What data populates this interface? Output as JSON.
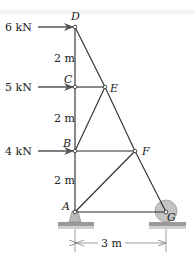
{
  "diagram": {
    "type": "truss",
    "nodes": {
      "A": {
        "label": "A",
        "x": 75,
        "y": 212
      },
      "B": {
        "label": "B",
        "x": 75,
        "y": 151
      },
      "C": {
        "label": "C",
        "x": 75,
        "y": 87
      },
      "D": {
        "label": "D",
        "x": 75,
        "y": 27
      },
      "E": {
        "label": "E",
        "x": 105,
        "y": 87
      },
      "F": {
        "label": "F",
        "x": 135,
        "y": 151
      },
      "G": {
        "label": "G",
        "x": 166,
        "y": 212
      }
    },
    "members": [
      "AB",
      "BC",
      "CD",
      "DE",
      "EF",
      "FG",
      "CE",
      "BE",
      "BF",
      "AF",
      "AG"
    ],
    "loads": [
      {
        "node": "D",
        "label": "6 kN"
      },
      {
        "node": "C",
        "label": "5 kN"
      },
      {
        "node": "B",
        "label": "4 kN"
      }
    ],
    "dimensions": {
      "DC": "2 m",
      "CB": "2 m",
      "BA": "2 m",
      "AG": "3 m"
    },
    "supports": {
      "A": "pin",
      "G": "roller"
    },
    "colors": {
      "member": "#2a2a2a",
      "arrow": "#555555",
      "support_fill": "#b8b8b8",
      "ground": "#9a9a9a",
      "roller_fill": "#c4c4c4"
    }
  }
}
